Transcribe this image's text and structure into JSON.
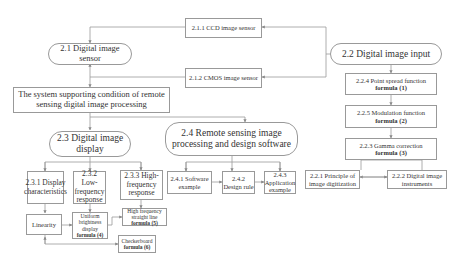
{
  "nodes": {
    "n211": {
      "label": "2.1.1  CCD image sensor"
    },
    "n212": {
      "label": "2.1.2  CMOS image sensor"
    },
    "n21": {
      "label": "2.1 Digital image sensor"
    },
    "n22": {
      "label": "2.2 Digital image input"
    },
    "root": {
      "label": "The system supporting condition of remote sensing digital image processing"
    },
    "n224": {
      "label": "2.2.4  Point spread function",
      "formula": "formula (1)"
    },
    "n225": {
      "label": "2.2.5  Modulation function",
      "formula": "formula (2)"
    },
    "n223": {
      "label": "2.2.3  Gamma correction",
      "formula": "formula (3)"
    },
    "n221": {
      "label": "2.2.1  Principle of image digitization"
    },
    "n222": {
      "label": "2.2.2  Digital image instruments"
    },
    "n23": {
      "label": "2.3  Digital image display"
    },
    "n24": {
      "label": "2.4 Remote sensing image processing and design software"
    },
    "n231": {
      "label": "2.3.1 Display characteristics"
    },
    "n232": {
      "label": "2.3.2 Low-frequency response"
    },
    "n233": {
      "label": "2.3.3 High-frequency response"
    },
    "n241": {
      "label": "2.4.1 Software example"
    },
    "n242": {
      "label": "2.4.2 Design rule"
    },
    "n243": {
      "label": "2.4.3 Application example"
    },
    "linearity": {
      "label": "Linearity"
    },
    "uniform": {
      "label": "Uniform brightness display",
      "formula": "formula (4)"
    },
    "highfreq": {
      "label": "High frequency straight line",
      "formula": "formula (5)"
    },
    "checker": {
      "label": "Checkerboard",
      "formula": "formula (6)"
    }
  }
}
